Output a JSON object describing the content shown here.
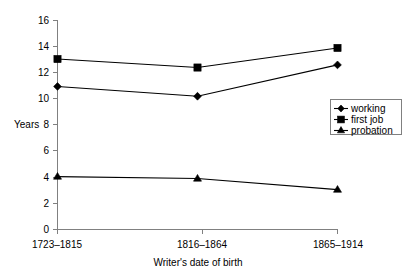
{
  "chart_data": {
    "type": "line",
    "title": "",
    "xlabel": "Writer's date of birth",
    "ylabel": "Years",
    "categories": [
      "1723–1815",
      "1816–1864",
      "1865–1914"
    ],
    "series": [
      {
        "name": "working",
        "marker": "diamond",
        "values": [
          10.95,
          10.2,
          12.6
        ]
      },
      {
        "name": "first job",
        "marker": "square",
        "values": [
          13.05,
          12.4,
          13.9
        ]
      },
      {
        "name": "probation",
        "marker": "triangle",
        "values": [
          4.05,
          3.9,
          3.05
        ]
      }
    ],
    "ylim": [
      0,
      16
    ],
    "ytick_labels": [
      "0",
      "2",
      "4",
      "6",
      "8",
      "10",
      "12",
      "14",
      "16"
    ],
    "ytick_values": [
      0,
      2,
      4,
      6,
      8,
      10,
      12,
      14,
      16
    ],
    "grid": false,
    "legend_position": "right-middle",
    "line_color": "#000000",
    "axis_color": "#808080"
  },
  "axes": {
    "y_label": "Years",
    "x_label": "Writer's date of birth"
  },
  "legend": {
    "items": [
      {
        "label": "working"
      },
      {
        "label": "first job"
      },
      {
        "label": "probation"
      }
    ]
  },
  "ticks": {
    "y": [
      "16",
      "14",
      "12",
      "10",
      "8",
      "6",
      "4",
      "2",
      "0"
    ],
    "x": [
      "1723–1815",
      "1816–1864",
      "1865–1914"
    ]
  }
}
